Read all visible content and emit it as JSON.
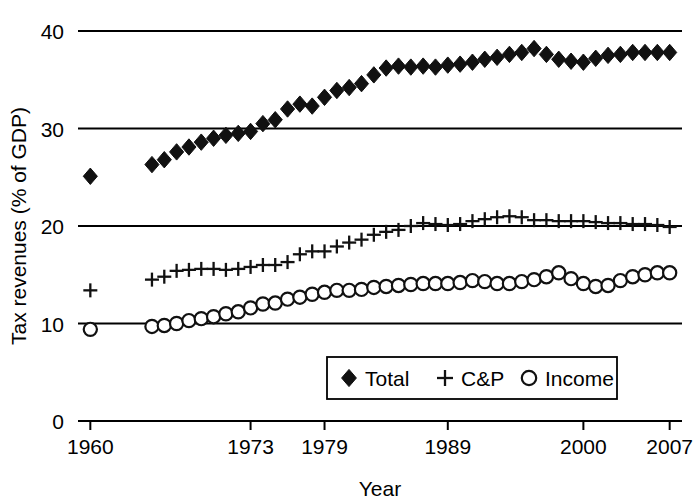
{
  "chart_data": {
    "type": "scatter",
    "title": "",
    "xlabel": "Year",
    "ylabel": "Tax revenues (% of GDP)",
    "xlim": [
      1959,
      2008
    ],
    "ylim": [
      0,
      40
    ],
    "xticks": [
      1960,
      1973,
      1979,
      1989,
      2000,
      2007
    ],
    "xticklabels": [
      "1960",
      "1973",
      "1979",
      "1989",
      "2000",
      "2007"
    ],
    "yticks": [
      0,
      10,
      20,
      30,
      40
    ],
    "yticklabels": [
      "0",
      "10",
      "20",
      "30",
      "40"
    ],
    "grid": "horizontal",
    "legend_position": "lower-center",
    "legend": [
      {
        "label": "Total",
        "marker": "filled-diamond"
      },
      {
        "label": "C&P",
        "marker": "plus"
      },
      {
        "label": "Income",
        "marker": "open-circle"
      }
    ],
    "x": [
      1960,
      1965,
      1966,
      1967,
      1968,
      1969,
      1970,
      1971,
      1972,
      1973,
      1974,
      1975,
      1976,
      1977,
      1978,
      1979,
      1980,
      1981,
      1982,
      1983,
      1984,
      1985,
      1986,
      1987,
      1988,
      1989,
      1990,
      1991,
      1992,
      1993,
      1994,
      1995,
      1996,
      1997,
      1998,
      1999,
      2000,
      2001,
      2002,
      2003,
      2004,
      2005,
      2006,
      2007
    ],
    "series": [
      {
        "name": "Total",
        "marker": "filled-diamond",
        "values": [
          25.1,
          26.3,
          26.8,
          27.6,
          28.1,
          28.6,
          29.0,
          29.3,
          29.5,
          29.7,
          30.5,
          30.9,
          32.0,
          32.5,
          32.3,
          33.2,
          33.9,
          34.2,
          34.6,
          35.5,
          36.2,
          36.4,
          36.3,
          36.4,
          36.3,
          36.5,
          36.6,
          36.8,
          37.1,
          37.3,
          37.6,
          37.8,
          38.2,
          37.6,
          37.1,
          36.9,
          36.8,
          37.2,
          37.5,
          37.6,
          37.8,
          37.8,
          37.8,
          37.8
        ],
        "color": "#111111"
      },
      {
        "name": "C&P",
        "marker": "plus",
        "values": [
          13.4,
          14.5,
          14.8,
          15.4,
          15.5,
          15.6,
          15.6,
          15.5,
          15.6,
          15.8,
          16.0,
          16.0,
          16.3,
          17.1,
          17.4,
          17.4,
          17.9,
          18.3,
          18.6,
          19.1,
          19.4,
          19.6,
          20.0,
          20.3,
          20.2,
          20.1,
          20.2,
          20.5,
          20.7,
          20.9,
          21.0,
          20.9,
          20.6,
          20.6,
          20.5,
          20.5,
          20.5,
          20.4,
          20.3,
          20.3,
          20.2,
          20.2,
          20.1,
          19.9
        ],
        "color": "#111111"
      },
      {
        "name": "Income",
        "marker": "open-circle",
        "values": [
          9.4,
          9.7,
          9.8,
          10.0,
          10.3,
          10.5,
          10.7,
          11.0,
          11.2,
          11.6,
          12.0,
          12.1,
          12.5,
          12.7,
          13.0,
          13.2,
          13.4,
          13.4,
          13.5,
          13.7,
          13.8,
          13.9,
          14.0,
          14.1,
          14.1,
          14.1,
          14.2,
          14.4,
          14.3,
          14.1,
          14.1,
          14.3,
          14.5,
          14.8,
          15.2,
          14.6,
          14.1,
          13.8,
          13.9,
          14.4,
          14.8,
          15.0,
          15.2,
          15.2
        ],
        "color": "#111111"
      }
    ]
  }
}
